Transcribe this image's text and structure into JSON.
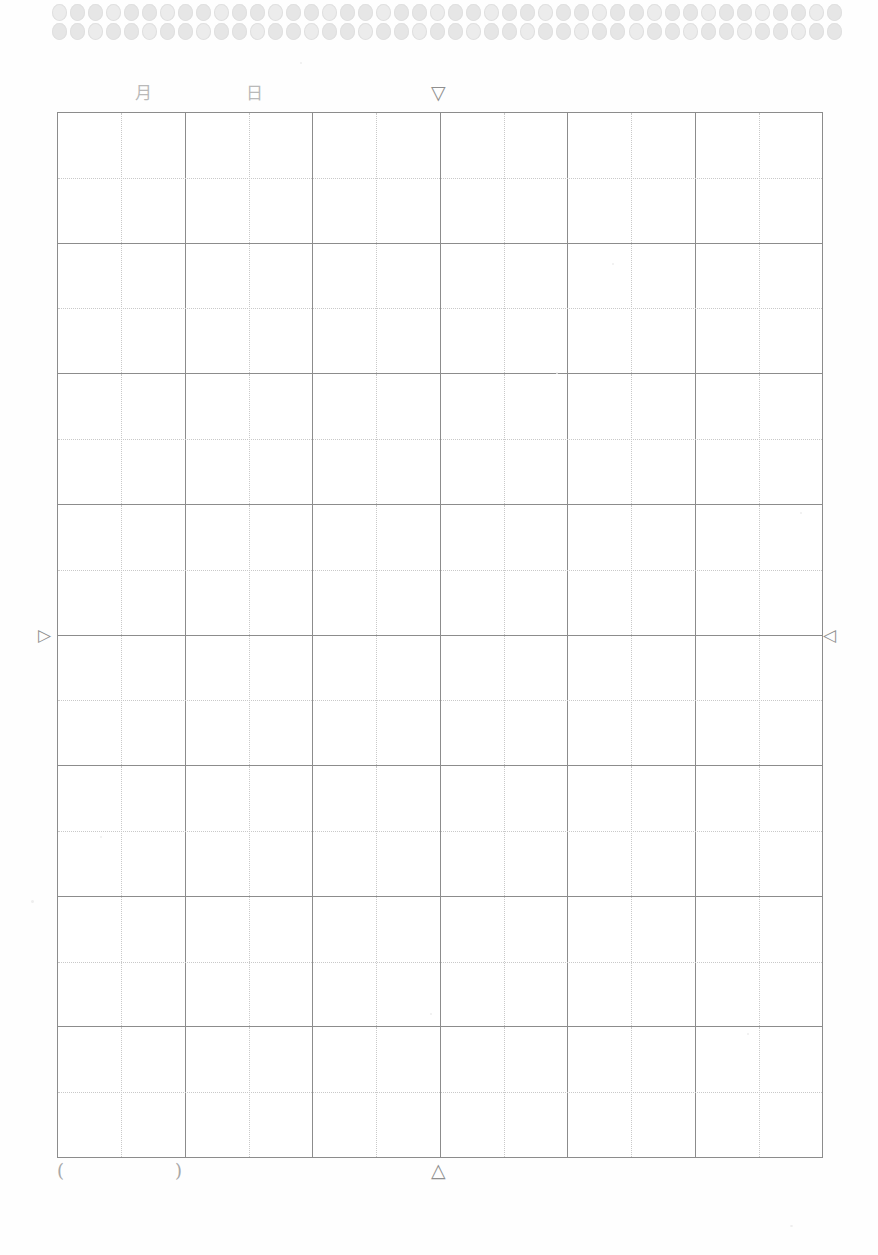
{
  "page": {
    "background_color": "#fefefe",
    "width": 878,
    "height": 1255
  },
  "top_band": {
    "name": "binding-dot-band",
    "rows": 2,
    "dots_per_row": 44,
    "dot_color": "#e6e6e6"
  },
  "header": {
    "month_label": "月",
    "day_label": "日",
    "center_marker": "▽",
    "center_marker_name": "top-center-triangle"
  },
  "side_markers": {
    "left_marker": "▷",
    "right_marker": "◁"
  },
  "grid": {
    "major_columns": 6,
    "major_rows": 8,
    "subdivisions_per_cell": 2,
    "solid_line_color": "#8c8c8c",
    "dotted_line_color": "#c9c9c9",
    "cell_background": "#ffffff"
  },
  "footer": {
    "paren_open": "(",
    "paren_close": ")",
    "center_marker": "△",
    "center_marker_name": "bottom-center-triangle"
  }
}
